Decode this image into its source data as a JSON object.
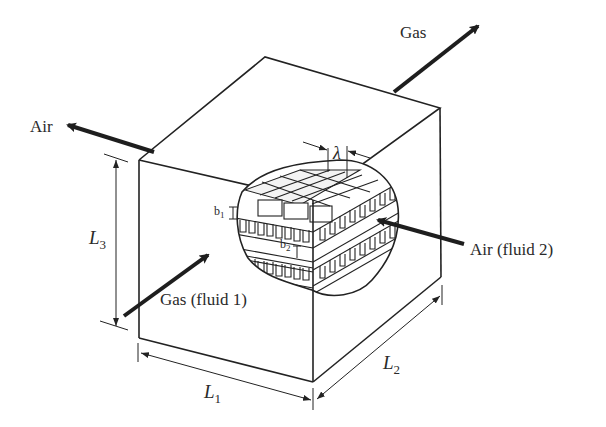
{
  "diagram": {
    "type": "cross-flow plate-fin heat exchanger core (isometric cutaway)",
    "flows": {
      "gas_out": "Gas",
      "air_out": "Air",
      "gas_in": "Gas (fluid 1)",
      "air_in": "Air (fluid 2)"
    },
    "dimensions": {
      "L1": {
        "symbol": "L",
        "sub": "1"
      },
      "L2": {
        "symbol": "L",
        "sub": "2"
      },
      "L3": {
        "symbol": "L",
        "sub": "3"
      }
    },
    "fin_labels": {
      "b1": {
        "symbol": "b",
        "sub": "1"
      },
      "b2": {
        "symbol": "b",
        "sub": "2"
      },
      "lambda": "λ"
    },
    "colors": {
      "line": "#222222",
      "background": "#ffffff"
    }
  }
}
